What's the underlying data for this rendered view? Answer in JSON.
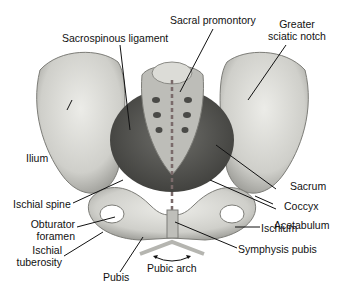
{
  "diagram": {
    "labels": {
      "sacral_promontory": "Sacral promontory",
      "greater_sciatic_notch_1": "Greater",
      "greater_sciatic_notch_2": "sciatic notch",
      "sacrospinous_ligament": "Sacrospinous ligament",
      "ilium": "Ilium",
      "sacrum": "Sacrum",
      "coccyx": "Coccyx",
      "ischial_spine": "Ischial spine",
      "acetabulum": "Acetabulum",
      "obturator_foramen_1": "Obturator",
      "obturator_foramen_2": "foramen",
      "ischium": "Ischium",
      "ischial_tuberosity_1": "Ischial",
      "ischial_tuberosity_2": "tuberosity",
      "symphysis_pubis": "Symphysis pubis",
      "pubic_arch": "Pubic arch",
      "pubis": "Pubis"
    },
    "colors": {
      "bone": "#d9d9d4",
      "bone_shadow": "#8f8f8a",
      "arch_marker": "#b5b5b0",
      "axis_line": "#7a6a6a",
      "leader": "#111111"
    }
  }
}
